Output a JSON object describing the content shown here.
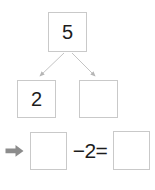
{
  "worksheet": {
    "type": "number-bond-subtraction",
    "colors": {
      "box_border": "#c9c9c9",
      "digit": "#1c1c1c",
      "connector_arrow": "#b5b5b5",
      "row_marker_arrow": "#8c8c8c",
      "background": "#ffffff"
    }
  },
  "number_bond": {
    "whole": {
      "label": "whole-box",
      "value": "5",
      "filled": true
    },
    "parts": [
      {
        "label": "part-box-left",
        "value": "2",
        "filled": true
      },
      {
        "label": "part-box-right",
        "value": "",
        "filled": false
      }
    ],
    "connectors": [
      {
        "name": "arrow-to-left-part",
        "from": "whole",
        "to": "part-left"
      },
      {
        "name": "arrow-to-right-part",
        "from": "whole",
        "to": "part-right"
      }
    ]
  },
  "equation": {
    "marker_icon": "right-arrow-icon",
    "minuend": {
      "label": "minuend-answer-box",
      "value": "",
      "filled": false
    },
    "operator_text": "−2=",
    "subtrahend": "2",
    "equals_sign": "=",
    "difference": {
      "label": "difference-answer-box",
      "value": "",
      "filled": false
    }
  }
}
